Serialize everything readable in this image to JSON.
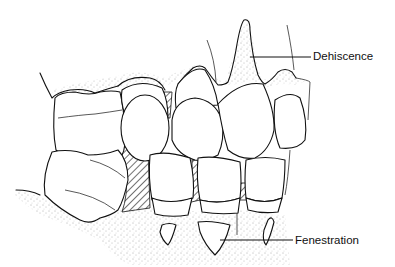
{
  "figure": {
    "type": "dental illustration (dentition with alveolar bone defects)",
    "labels": {
      "dehiscence": "Dehiscence",
      "fenestration": "Fenestration"
    }
  }
}
